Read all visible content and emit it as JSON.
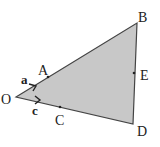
{
  "diagram": {
    "colors": {
      "fill": "#c8c8c8",
      "stroke": "#444444",
      "text": "#222222"
    },
    "points": {
      "O": {
        "label": "O"
      },
      "A": {
        "label": "A"
      },
      "B": {
        "label": "B"
      },
      "C": {
        "label": "C"
      },
      "D": {
        "label": "D"
      },
      "E": {
        "label": "E"
      }
    },
    "vectors": {
      "a": {
        "label": "a",
        "along": "OA"
      },
      "c": {
        "label": "c",
        "along": "OC"
      }
    },
    "shape": "triangle OBD with points A on OB, C on OD, E on BD"
  }
}
